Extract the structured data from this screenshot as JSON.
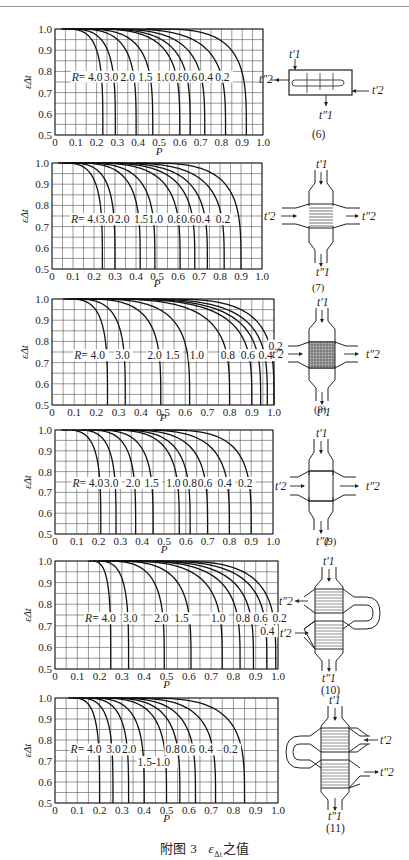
{
  "caption": {
    "prefix": "附图 3",
    "symbol": "ε",
    "subscript": "Δt",
    "suffix": "之值"
  },
  "chart_data": [
    {
      "id": "6",
      "type": "line",
      "title": "",
      "xlabel": "P",
      "ylabel": "εΔt",
      "xlim": [
        0,
        1.0
      ],
      "ylim": [
        0.5,
        1.0
      ],
      "grid": true,
      "x_ticks": [
        "0",
        "0.1",
        "0.2",
        "0.3",
        "0.4",
        "0.5",
        "0.6",
        "0.7",
        "0.8",
        "0.9",
        "1.0"
      ],
      "y_ticks": [
        "0.5",
        "0.6",
        "0.7",
        "0.8",
        "0.9",
        "1.0"
      ],
      "series": [
        {
          "name": "R=4.0",
          "p_start": 0.03,
          "p_end": 0.23
        },
        {
          "name": "R=3.0",
          "p_start": 0.04,
          "p_end": 0.29
        },
        {
          "name": "R=2.0",
          "p_start": 0.06,
          "p_end": 0.39
        },
        {
          "name": "R=1.5",
          "p_start": 0.08,
          "p_end": 0.47
        },
        {
          "name": "R=1.0",
          "p_start": 0.12,
          "p_end": 0.6
        },
        {
          "name": "R=0.8",
          "p_start": 0.14,
          "p_end": 0.65
        },
        {
          "name": "R=0.6",
          "p_start": 0.18,
          "p_end": 0.72
        },
        {
          "name": "R=0.4",
          "p_start": 0.24,
          "p_end": 0.82
        },
        {
          "name": "R=0.2",
          "p_start": 0.44,
          "p_end": 0.92
        }
      ],
      "labels": [
        {
          "text": "R= 4.0",
          "p": 0.08,
          "e": 0.775
        },
        {
          "text": "3.0",
          "p": 0.235,
          "e": 0.775
        },
        {
          "text": "2.0",
          "p": 0.315,
          "e": 0.775
        },
        {
          "text": "1.5",
          "p": 0.4,
          "e": 0.775
        },
        {
          "text": "1.0",
          "p": 0.485,
          "e": 0.775
        },
        {
          "text": "0.8",
          "p": 0.55,
          "e": 0.775
        },
        {
          "text": "0.6",
          "p": 0.615,
          "e": 0.775
        },
        {
          "text": "0.4",
          "p": 0.69,
          "e": 0.775
        },
        {
          "text": "0.2",
          "p": 0.77,
          "e": 0.775
        }
      ]
    },
    {
      "id": "7",
      "type": "line",
      "title": "",
      "xlabel": "P",
      "ylabel": "εΔt",
      "xlim": [
        0,
        1.0
      ],
      "ylim": [
        0.5,
        1.0
      ],
      "grid": true,
      "x_ticks": [
        "0",
        "0.1",
        "0.2",
        "0.3",
        "0.4",
        "0.5",
        "0.6",
        "0.7",
        "0.8",
        "0.9",
        "1.0"
      ],
      "y_ticks": [
        "0.5",
        "0.6",
        "0.7",
        "0.8",
        "0.9",
        "1.0"
      ],
      "series": [
        {
          "name": "R=4.0",
          "p_start": 0.03,
          "p_end": 0.24
        },
        {
          "name": "R=3.0",
          "p_start": 0.05,
          "p_end": 0.3
        },
        {
          "name": "R=2.0",
          "p_start": 0.07,
          "p_end": 0.42
        },
        {
          "name": "R=1.5",
          "p_start": 0.09,
          "p_end": 0.49
        },
        {
          "name": "R=1.0",
          "p_start": 0.12,
          "p_end": 0.61
        },
        {
          "name": "R=0.8",
          "p_start": 0.15,
          "p_end": 0.68
        },
        {
          "name": "R=0.6",
          "p_start": 0.19,
          "p_end": 0.74
        },
        {
          "name": "R=0.4",
          "p_start": 0.25,
          "p_end": 0.82
        },
        {
          "name": "R=0.2",
          "p_start": 0.4,
          "p_end": 0.9
        }
      ],
      "labels": [
        {
          "text": "R= 4.0",
          "p": 0.09,
          "e": 0.735
        },
        {
          "text": "3.0",
          "p": 0.225,
          "e": 0.735
        },
        {
          "text": "2.0",
          "p": 0.3,
          "e": 0.735
        },
        {
          "text": "1.5",
          "p": 0.39,
          "e": 0.735
        },
        {
          "text": "1.0",
          "p": 0.46,
          "e": 0.735
        },
        {
          "text": "0.8",
          "p": 0.55,
          "e": 0.735
        },
        {
          "text": "0.6",
          "p": 0.615,
          "e": 0.735
        },
        {
          "text": "0.4",
          "p": 0.685,
          "e": 0.735
        },
        {
          "text": "0.2",
          "p": 0.78,
          "e": 0.735
        }
      ]
    },
    {
      "id": "8",
      "type": "line",
      "title": "",
      "xlabel": "P",
      "ylabel": "εΔt",
      "xlim": [
        0,
        1.0
      ],
      "ylim": [
        0.5,
        1.0
      ],
      "grid": true,
      "x_ticks": [
        "0",
        "0.1",
        "0.2",
        "0.3",
        "0.4",
        "0.5",
        "0.6",
        "0.7",
        "0.8",
        "0.9",
        "1.0"
      ],
      "y_ticks": [
        "0.5",
        "0.6",
        "0.7",
        "0.8",
        "0.9",
        "1.0"
      ],
      "series": [
        {
          "name": "R=4.0",
          "p_start": 0.05,
          "p_end": 0.25
        },
        {
          "name": "R=3.0",
          "p_start": 0.07,
          "p_end": 0.33
        },
        {
          "name": "R=2.0",
          "p_start": 0.1,
          "p_end": 0.49
        },
        {
          "name": "R=1.5",
          "p_start": 0.12,
          "p_end": 0.62
        },
        {
          "name": "R=1.0",
          "p_start": 0.15,
          "p_end": 0.8
        },
        {
          "name": "R=0.8",
          "p_start": 0.18,
          "p_end": 0.9
        },
        {
          "name": "R=0.6",
          "p_start": 0.22,
          "p_end": 0.94
        },
        {
          "name": "R=0.4",
          "p_start": 0.3,
          "p_end": 0.97
        },
        {
          "name": "R=0.2",
          "p_start": 0.45,
          "p_end": 1.0
        }
      ],
      "labels": [
        {
          "text": "R= 4.0",
          "p": 0.1,
          "e": 0.735
        },
        {
          "text": "3.0",
          "p": 0.285,
          "e": 0.735
        },
        {
          "text": "2.0",
          "p": 0.43,
          "e": 0.735
        },
        {
          "text": "1.5",
          "p": 0.51,
          "e": 0.735
        },
        {
          "text": "1.0",
          "p": 0.62,
          "e": 0.735
        },
        {
          "text": "0.8",
          "p": 0.76,
          "e": 0.735
        },
        {
          "text": "0.6",
          "p": 0.85,
          "e": 0.735
        },
        {
          "text": "0.4",
          "p": 0.93,
          "e": 0.735
        },
        {
          "text": "0.2",
          "p": 0.975,
          "e": 0.78
        }
      ]
    },
    {
      "id": "9",
      "type": "line",
      "title": "",
      "xlabel": "P",
      "ylabel": "εΔt",
      "xlim": [
        0,
        1.0
      ],
      "ylim": [
        0.5,
        1.0
      ],
      "grid": true,
      "x_ticks": [
        "0",
        "0.1",
        "0.2",
        "0.3",
        "0.4",
        "0.5",
        "0.6",
        "0.7",
        "0.8",
        "0.9",
        "1.0"
      ],
      "y_ticks": [
        "0.5",
        "0.6",
        "0.7",
        "0.8",
        "0.9",
        "1.0"
      ],
      "series": [
        {
          "name": "R=4.0",
          "p_start": 0.03,
          "p_end": 0.21
        },
        {
          "name": "R=3.0",
          "p_start": 0.08,
          "p_end": 0.28
        },
        {
          "name": "R=2.0",
          "p_start": 0.12,
          "p_end": 0.37
        },
        {
          "name": "R=1.5",
          "p_start": 0.15,
          "p_end": 0.45
        },
        {
          "name": "R=1.0",
          "p_start": 0.2,
          "p_end": 0.57
        },
        {
          "name": "R=0.8",
          "p_start": 0.23,
          "p_end": 0.62
        },
        {
          "name": "R=0.6",
          "p_start": 0.27,
          "p_end": 0.7
        },
        {
          "name": "R=0.4",
          "p_start": 0.33,
          "p_end": 0.8
        },
        {
          "name": "R=0.2",
          "p_start": 0.45,
          "p_end": 0.9
        }
      ],
      "labels": [
        {
          "text": "R= 4.0",
          "p": 0.08,
          "e": 0.745
        },
        {
          "text": "3.0",
          "p": 0.225,
          "e": 0.745
        },
        {
          "text": "2.0",
          "p": 0.325,
          "e": 0.745
        },
        {
          "text": "1.5",
          "p": 0.41,
          "e": 0.745
        },
        {
          "text": "1.0",
          "p": 0.51,
          "e": 0.745
        },
        {
          "text": "0.8",
          "p": 0.585,
          "e": 0.745
        },
        {
          "text": "0.6",
          "p": 0.655,
          "e": 0.745
        },
        {
          "text": "0.4",
          "p": 0.745,
          "e": 0.745
        },
        {
          "text": "0.2",
          "p": 0.84,
          "e": 0.745
        }
      ]
    },
    {
      "id": "10",
      "type": "line",
      "title": "",
      "xlabel": "P",
      "ylabel": "εΔt",
      "xlim": [
        0,
        1.0
      ],
      "ylim": [
        0.5,
        1.0
      ],
      "grid": true,
      "x_ticks": [
        "0",
        "0.1",
        "0.2",
        "0.3",
        "0.4",
        "0.5",
        "0.6",
        "0.7",
        "0.8",
        "0.9",
        "1.0"
      ],
      "y_ticks": [
        "0.5",
        "0.6",
        "0.7",
        "0.8",
        "0.9",
        "1.0"
      ],
      "series": [
        {
          "name": "R=4.0",
          "p_start": 0.15,
          "p_end": 0.25
        },
        {
          "name": "R=3.0",
          "p_start": 0.17,
          "p_end": 0.33
        },
        {
          "name": "R=2.0",
          "p_start": 0.19,
          "p_end": 0.49
        },
        {
          "name": "R=1.5",
          "p_start": 0.21,
          "p_end": 0.61
        },
        {
          "name": "R=1.0",
          "p_start": 0.23,
          "p_end": 0.75
        },
        {
          "name": "R=0.8",
          "p_start": 0.26,
          "p_end": 0.83
        },
        {
          "name": "R=0.6",
          "p_start": 0.3,
          "p_end": 0.89
        },
        {
          "name": "R=0.4",
          "p_start": 0.36,
          "p_end": 0.95
        },
        {
          "name": "R=0.2",
          "p_start": 0.45,
          "p_end": 0.99
        }
      ],
      "labels": [
        {
          "text": "R= 4.0",
          "p": 0.135,
          "e": 0.735
        },
        {
          "text": "3.0",
          "p": 0.305,
          "e": 0.735
        },
        {
          "text": "2.0",
          "p": 0.445,
          "e": 0.735
        },
        {
          "text": "1.5",
          "p": 0.535,
          "e": 0.735
        },
        {
          "text": "1.0",
          "p": 0.7,
          "e": 0.735
        },
        {
          "text": "0.8",
          "p": 0.81,
          "e": 0.735
        },
        {
          "text": "0.6",
          "p": 0.89,
          "e": 0.735
        },
        {
          "text": "0.4",
          "p": 0.92,
          "e": 0.675
        },
        {
          "text": "0.2",
          "p": 0.975,
          "e": 0.735
        }
      ]
    },
    {
      "id": "11",
      "type": "line",
      "title": "",
      "xlabel": "P",
      "ylabel": "εΔt",
      "xlim": [
        0,
        1.0
      ],
      "ylim": [
        0.5,
        1.0
      ],
      "grid": true,
      "x_ticks": [
        "0",
        "0.1",
        "0.2",
        "0.3",
        "0.4",
        "0.5",
        "0.6",
        "0.7",
        "0.8",
        "0.9",
        "1.0"
      ],
      "y_ticks": [
        "0.5",
        "0.6",
        "0.7",
        "0.8",
        "0.9",
        "1.0"
      ],
      "series": [
        {
          "name": "R=4.0",
          "p_start": 0.06,
          "p_end": 0.2
        },
        {
          "name": "R=3.0",
          "p_start": 0.08,
          "p_end": 0.26
        },
        {
          "name": "R=2.0",
          "p_start": 0.1,
          "p_end": 0.33
        },
        {
          "name": "R=1.5",
          "p_start": 0.12,
          "p_end": 0.4
        },
        {
          "name": "R=1.0",
          "p_start": 0.15,
          "p_end": 0.5
        },
        {
          "name": "R=0.8",
          "p_start": 0.18,
          "p_end": 0.56
        },
        {
          "name": "R=0.6",
          "p_start": 0.21,
          "p_end": 0.63
        },
        {
          "name": "R=0.4",
          "p_start": 0.26,
          "p_end": 0.72
        },
        {
          "name": "R=0.2",
          "p_start": 0.34,
          "p_end": 0.85
        }
      ],
      "labels": [
        {
          "text": "R= 4.0",
          "p": 0.07,
          "e": 0.755
        },
        {
          "text": "3.0",
          "p": 0.23,
          "e": 0.755
        },
        {
          "text": "2.0",
          "p": 0.3,
          "e": 0.755
        },
        {
          "text": "1.5-1.0",
          "p": 0.37,
          "e": 0.695
        },
        {
          "text": "0.8",
          "p": 0.495,
          "e": 0.755
        },
        {
          "text": "0.6",
          "p": 0.565,
          "e": 0.755
        },
        {
          "text": "0.4",
          "p": 0.645,
          "e": 0.755
        },
        {
          "text": "0.2",
          "p": 0.755,
          "e": 0.755
        }
      ]
    }
  ],
  "layout": {
    "charts": [
      {
        "left": 55,
        "top": 29,
        "width": 208,
        "height": 106,
        "xlabel_y": 155
      },
      {
        "left": 52,
        "top": 163,
        "width": 210,
        "height": 106,
        "xlabel_y": 287
      },
      {
        "left": 52,
        "top": 299,
        "width": 222,
        "height": 106,
        "xlabel_y": 421
      },
      {
        "left": 55,
        "top": 430,
        "width": 218,
        "height": 104,
        "xlabel_y": 553
      },
      {
        "left": 55,
        "top": 561,
        "width": 223,
        "height": 108,
        "xlabel_y": 688
      },
      {
        "left": 55,
        "top": 698,
        "width": 223,
        "height": 105,
        "xlabel_y": 822
      }
    ]
  },
  "diagrams": [
    {
      "id": "6",
      "label": "(6)",
      "t1_in": "t′1",
      "t1_out": "t″1",
      "t2_in": "t′2",
      "t2_out": "t″2"
    },
    {
      "id": "7",
      "label": "(7)",
      "t1_in": "t′1",
      "t1_out": "t″1",
      "t2_in": "t′2",
      "t2_out": "t″2"
    },
    {
      "id": "8",
      "label": "(8)",
      "t1_in": "t′1",
      "t1_out": "t″1",
      "t2_in": "t′2",
      "t2_out": "t″2"
    },
    {
      "id": "9",
      "label": "(9)",
      "t1_in": "t′1",
      "t1_out": "t″1",
      "t2_in": "t′2",
      "t2_out": "t″2"
    },
    {
      "id": "10",
      "label": "(10)",
      "t1_in": "t′1",
      "t1_out": "t″1",
      "t2_in": "t′2",
      "t2_out": "t″2"
    },
    {
      "id": "11",
      "label": "(11)",
      "t1_in": "t′1",
      "t1_out": "t″1",
      "t2_in": "t′2",
      "t2_out": "t″2"
    }
  ]
}
